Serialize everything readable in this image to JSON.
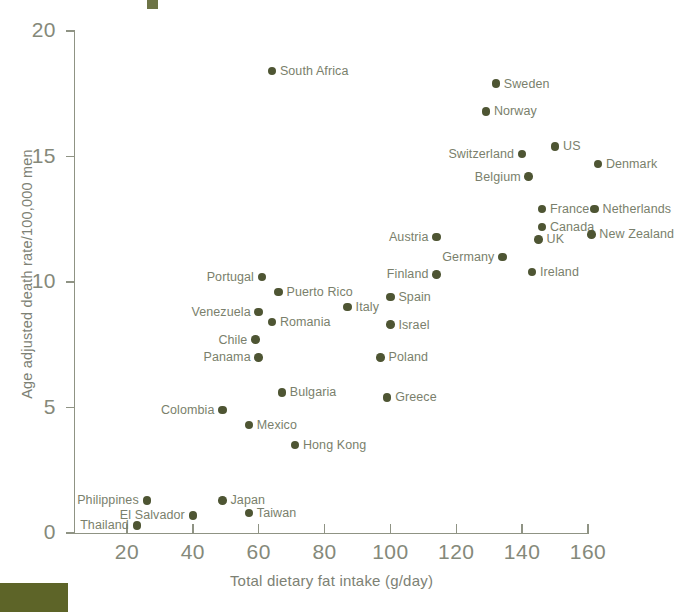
{
  "chart_data": {
    "type": "scatter",
    "title": "",
    "xlabel": "Total dietary fat intake (g/day)",
    "ylabel": "Age adjusted death rate/100,000 men",
    "xlim": [
      10,
      170
    ],
    "ylim": [
      0,
      20.6
    ],
    "xticks": [
      20,
      40,
      60,
      80,
      100,
      120,
      140,
      160
    ],
    "yticks": [
      0,
      5,
      10,
      15,
      20
    ],
    "grid": false,
    "legend": null,
    "marker_color": "#4e5533",
    "axis_color": "#8f9384",
    "text_color": "#7a7f6c",
    "points": [
      {
        "label": "South Africa",
        "x": 64,
        "y": 18.4,
        "label_pos": "right"
      },
      {
        "label": "Sweden",
        "x": 132,
        "y": 17.9,
        "label_pos": "right"
      },
      {
        "label": "Norway",
        "x": 129,
        "y": 16.8,
        "label_pos": "right"
      },
      {
        "label": "US",
        "x": 150,
        "y": 15.4,
        "label_pos": "right"
      },
      {
        "label": "Switzerland",
        "x": 140,
        "y": 15.1,
        "label_pos": "left"
      },
      {
        "label": "Denmark",
        "x": 163,
        "y": 14.7,
        "label_pos": "right"
      },
      {
        "label": "Belgium",
        "x": 142,
        "y": 14.2,
        "label_pos": "left"
      },
      {
        "label": "France",
        "x": 146,
        "y": 12.9,
        "label_pos": "right"
      },
      {
        "label": "Netherlands",
        "x": 162,
        "y": 12.9,
        "label_pos": "right"
      },
      {
        "label": "Canada",
        "x": 146,
        "y": 12.2,
        "label_pos": "right"
      },
      {
        "label": "New Zealand",
        "x": 161,
        "y": 11.9,
        "label_pos": "right"
      },
      {
        "label": "Austria",
        "x": 114,
        "y": 11.8,
        "label_pos": "left"
      },
      {
        "label": "UK",
        "x": 145,
        "y": 11.7,
        "label_pos": "right"
      },
      {
        "label": "Germany",
        "x": 134,
        "y": 11.0,
        "label_pos": "left"
      },
      {
        "label": "Ireland",
        "x": 143,
        "y": 10.4,
        "label_pos": "right"
      },
      {
        "label": "Finland",
        "x": 114,
        "y": 10.3,
        "label_pos": "left"
      },
      {
        "label": "Portugal",
        "x": 61,
        "y": 10.2,
        "label_pos": "left"
      },
      {
        "label": "Puerto Rico",
        "x": 66,
        "y": 9.6,
        "label_pos": "right"
      },
      {
        "label": "Spain",
        "x": 100,
        "y": 9.4,
        "label_pos": "right"
      },
      {
        "label": "Italy",
        "x": 87,
        "y": 9.0,
        "label_pos": "right"
      },
      {
        "label": "Venezuela",
        "x": 60,
        "y": 8.8,
        "label_pos": "left"
      },
      {
        "label": "Romania",
        "x": 64,
        "y": 8.4,
        "label_pos": "right"
      },
      {
        "label": "Israel",
        "x": 100,
        "y": 8.3,
        "label_pos": "right"
      },
      {
        "label": "Chile",
        "x": 59,
        "y": 7.7,
        "label_pos": "left"
      },
      {
        "label": "Panama",
        "x": 60,
        "y": 7.0,
        "label_pos": "left"
      },
      {
        "label": "Poland",
        "x": 97,
        "y": 7.0,
        "label_pos": "right"
      },
      {
        "label": "Bulgaria",
        "x": 67,
        "y": 5.6,
        "label_pos": "right"
      },
      {
        "label": "Greece",
        "x": 99,
        "y": 5.4,
        "label_pos": "right"
      },
      {
        "label": "Colombia",
        "x": 49,
        "y": 4.9,
        "label_pos": "left"
      },
      {
        "label": "Mexico",
        "x": 57,
        "y": 4.3,
        "label_pos": "right"
      },
      {
        "label": "Hong Kong",
        "x": 71,
        "y": 3.5,
        "label_pos": "right"
      },
      {
        "label": "Japan",
        "x": 49,
        "y": 1.3,
        "label_pos": "right"
      },
      {
        "label": "Philippines",
        "x": 26,
        "y": 1.3,
        "label_pos": "left"
      },
      {
        "label": "Taiwan",
        "x": 57,
        "y": 0.8,
        "label_pos": "right"
      },
      {
        "label": "El Salvador",
        "x": 40,
        "y": 0.7,
        "label_pos": "left"
      },
      {
        "label": "Thailand",
        "x": 23,
        "y": 0.3,
        "label_pos": "left"
      }
    ]
  }
}
